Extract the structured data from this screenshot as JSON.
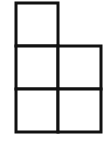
{
  "diagram": {
    "stroke_color": "#111111",
    "background": "#ffffff",
    "stroke_width": 3,
    "cells": [
      {
        "row": 0,
        "col": 0,
        "x": 16,
        "y": 3,
        "w": 42,
        "h": 43
      },
      {
        "row": 1,
        "col": 0,
        "x": 16,
        "y": 46,
        "w": 42,
        "h": 43
      },
      {
        "row": 1,
        "col": 1,
        "x": 58,
        "y": 46,
        "w": 43,
        "h": 43
      },
      {
        "row": 2,
        "col": 0,
        "x": 16,
        "y": 89,
        "w": 42,
        "h": 43
      },
      {
        "row": 2,
        "col": 1,
        "x": 58,
        "y": 89,
        "w": 43,
        "h": 43
      }
    ]
  }
}
